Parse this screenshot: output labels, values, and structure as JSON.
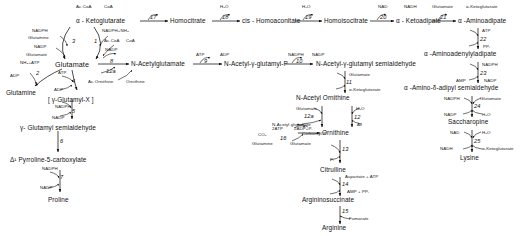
{
  "diagram": {
    "type": "metabolic-pathway"
  },
  "metabolites": {
    "alpha_ketoglutarate": "α - Ketoglutarate",
    "glutamate": "Glutamate",
    "glutamine": "Glutamine",
    "gamma_glutamyl_x": "[ γ-Glutamyl-X ]",
    "gamma_glutamyl_semialdehyde": "γ- Glutamyl semialdehyde",
    "pyrroline_carboxylate": "Δ¹ Pyrroline-5-carboxylate",
    "proline": "Proline",
    "n_acetylglutamate": "N-Acetylglutamate",
    "n_acetyl_gamma_glutamyl_p": "N-Acetyl-γ-glutamyl-P",
    "n_acetyl_gamma_glutamyl_semialdehyde": "N-Acetyl-γ-glutamyl semialdehyde",
    "n_acetyl_ornithine": "N-Acetyl Ornithine",
    "ornithine": "Ornithine",
    "citrulline": "Citrulline",
    "argininosuccinate": "Argininosuccinate",
    "arginine": "Arginine",
    "carbamyl_p": "Carbamyl-P",
    "homocitrate": "Homocitrate",
    "cis_homoaconitate": "cis - Homoaconitate",
    "homoisocitrate": "Homoisocitrate",
    "alpha_ketoadipate": "α - Ketoadipate",
    "alpha_aminoadipate": "α -Aminoadipate",
    "alpha_aminoadenylyladipate": "α -Aminoadenylyladipate",
    "alpha_amino_delta_adipyl_semialdehyde": "α -Amino-δ-adipyl semialdehyde",
    "saccharopine": "Saccharopine",
    "lysine": "Lysine"
  },
  "steps": {
    "s1": "1",
    "s2": "2",
    "s3": "3",
    "s4": "4",
    "s5": "5",
    "s6": "6",
    "s7": "7",
    "s8": "8",
    "s9": "9",
    "s10": "10",
    "s11": "11",
    "s12": "12",
    "s12a": "12a",
    "s13": "13",
    "s14": "14",
    "s15": "15",
    "s16": "16",
    "s17": "17",
    "s18": "18",
    "s19": "19",
    "s20": "20",
    "s21": "21",
    "s22": "22",
    "s23": "23",
    "s24": "24",
    "s25": "25"
  },
  "cofactors": {
    "nadph": "NADPH",
    "nadp": "NADP",
    "nad": "NAD",
    "nadh": "NADH",
    "atp": "ATP",
    "adp": "ADP",
    "amp": "AMP",
    "accoa": "Ac.CoA",
    "coa": "CoA",
    "h2o": "H₂O",
    "co2": "CO₂",
    "pi": "Pᵢ",
    "ppi": "PPᵢ",
    "glutamate": "Glutamate",
    "glutamine": "Glutamine",
    "akg": "α-Ketoglutarate",
    "nh3_atp": "NH₃+ATP",
    "nadph_nh3": "NADPH+NH₃",
    "ac_ornithine": "Ac.Ornithine",
    "ornithine": "Ornithine",
    "n_acetyl_glutamate": "N-Acetyl glutamate",
    "ac": "Ac",
    "aspartate_atp": "Aspartate + ATP",
    "amp_ppi": "AMP + PPᵢ",
    "fumarate": "Fumarate",
    "two_atp": "2ATP",
    "two_adp_pi": "2ADP+Pᵢ"
  }
}
